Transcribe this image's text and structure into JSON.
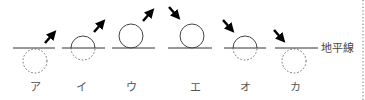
{
  "diagram": {
    "horizon_label": "地平線",
    "colors": {
      "line": "#333333",
      "dashed": "#666666",
      "arrow": "#000000",
      "text": "#555555",
      "border_dots": "#888888"
    },
    "items": [
      {
        "label": "ア",
        "sun_position": "below horizon (fully hidden)",
        "arrow_direction": "up-right (rising)"
      },
      {
        "label": "イ",
        "sun_position": "half above horizon",
        "arrow_direction": "up-right (rising)"
      },
      {
        "label": "ウ",
        "sun_position": "fully above horizon, touching",
        "arrow_direction": "up-right (rising)"
      },
      {
        "label": "エ",
        "sun_position": "fully above horizon, touching",
        "arrow_direction": "down-right (setting)"
      },
      {
        "label": "オ",
        "sun_position": "half above horizon",
        "arrow_direction": "down-right (setting)"
      },
      {
        "label": "カ",
        "sun_position": "below horizon (fully hidden)",
        "arrow_direction": "down-right (setting)"
      }
    ]
  }
}
